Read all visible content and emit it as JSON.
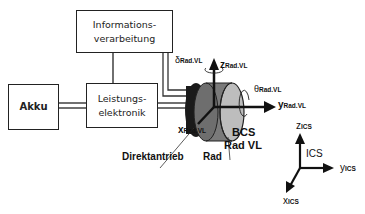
{
  "blocks": {
    "info": {
      "line1": "Informations-",
      "line2": "verarbeitung"
    },
    "akku": {
      "label": "Akku"
    },
    "leistung": {
      "line1": "Leistungs-",
      "line2": "elektronik"
    }
  },
  "wheel": {
    "z_axis": {
      "sym": "z",
      "sub": "Rad.VL"
    },
    "y_axis": {
      "sym": "y",
      "sub": "Rad.VL"
    },
    "x_axis": {
      "sym": "x",
      "sub": "Rad.VL"
    },
    "delta": {
      "sym": "δ",
      "sub": "Rad.VL"
    },
    "theta": {
      "sym": "θ",
      "sub": "Rad.VL"
    },
    "bcs_line1": "BCS",
    "bcs_line2": "Rad VL",
    "direktantrieb": "Direktantrieb",
    "rad": "Rad"
  },
  "ics": {
    "label": "ICS",
    "z_axis": {
      "sym": "z",
      "sub": "ICS"
    },
    "y_axis": {
      "sym": "y",
      "sub": "ICS"
    },
    "x_axis": {
      "sym": "x",
      "sub": "ICS"
    }
  }
}
